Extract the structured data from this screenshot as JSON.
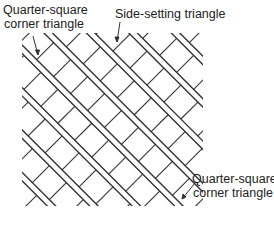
{
  "diagram": {
    "type": "quilt-layout",
    "labels": {
      "top_left": {
        "line1": "Quarter-square",
        "line2": "corner triangle"
      },
      "top": {
        "line1": "Side-setting triangle"
      },
      "bottom_right": {
        "line1": "Quarter-square",
        "line2": "corner triangle"
      }
    },
    "colors": {
      "line": "#333333",
      "text": "#222222",
      "background": "#ffffff"
    }
  }
}
